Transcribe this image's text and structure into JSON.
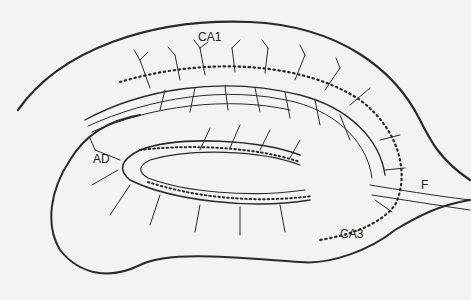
{
  "diagram": {
    "labels": {
      "ca1": "CA1",
      "ca3": "CA3",
      "ad": "AD",
      "f": "F"
    }
  }
}
